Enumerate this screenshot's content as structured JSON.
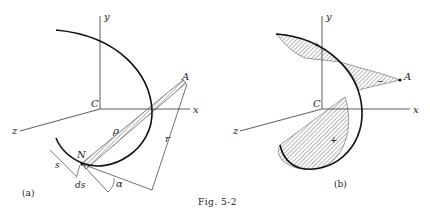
{
  "figure": {
    "caption": "Fig. 5-2",
    "panel_a": {
      "label": "(a)",
      "axes": {
        "x": "x",
        "y": "y",
        "z": "z",
        "origin": "C"
      },
      "point_A": "A",
      "point_N": "N",
      "rho": "ρ",
      "r": "r",
      "s": "s",
      "ds": "ds",
      "alpha": "α"
    },
    "panel_b": {
      "label": "(b)",
      "axes": {
        "x": "x",
        "y": "y",
        "z": "z",
        "origin": "C"
      },
      "point_A": "A",
      "signs": {
        "top": "+",
        "middle": "−",
        "bottom": "+"
      }
    },
    "colors": {
      "ink": "#222222",
      "background": "#ffffff"
    }
  }
}
